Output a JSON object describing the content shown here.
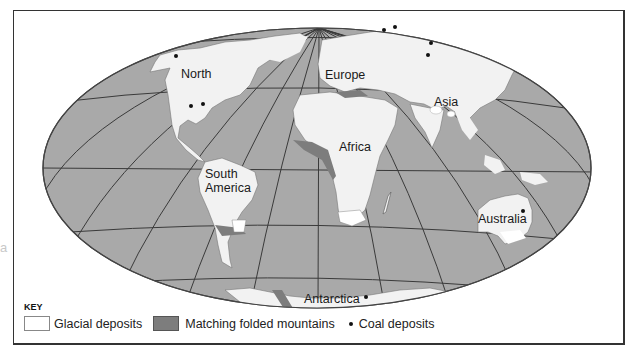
{
  "map": {
    "projection": "oval-world",
    "colors": {
      "ocean": "#a9a9a9",
      "land": "#f2f2f2",
      "folded_mountains": "#7d7d7d",
      "graticule": "#3a3a3a",
      "coal": "#111111"
    },
    "labels": {
      "north": "North",
      "europe": "Europe",
      "asia": "Asia",
      "africa": "Africa",
      "south_america_1": "South",
      "south_america_2": "America",
      "australia": "Australia",
      "antarctica": "Antarctica"
    },
    "coal_deposits": [
      {
        "region": "North America (NW)",
        "x": 176,
        "y": 56
      },
      {
        "region": "North America (E)",
        "x": 191,
        "y": 106
      },
      {
        "region": "North America (E)",
        "x": 203,
        "y": 104
      },
      {
        "region": "Europe (N)",
        "x": 384,
        "y": 30
      },
      {
        "region": "Europe (N)",
        "x": 395,
        "y": 27
      },
      {
        "region": "Asia",
        "x": 431,
        "y": 43
      },
      {
        "region": "Asia",
        "x": 428,
        "y": 55
      },
      {
        "region": "Australia",
        "x": 523,
        "y": 211
      },
      {
        "region": "Antarctica",
        "x": 366,
        "y": 297
      }
    ]
  },
  "key": {
    "title": "KEY",
    "items": [
      {
        "label": "Glacial deposits",
        "symbol": "white-box"
      },
      {
        "label": "Matching folded mountains",
        "symbol": "grey-box"
      },
      {
        "label": "Coal deposits",
        "symbol": "dot"
      }
    ]
  },
  "stray_mark": "a"
}
